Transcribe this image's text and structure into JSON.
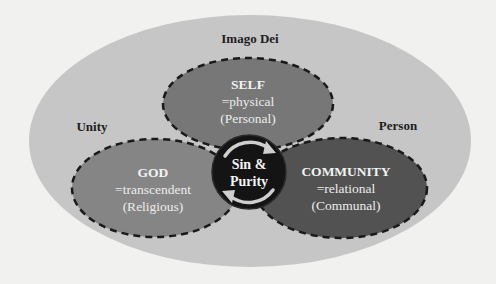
{
  "diagram": {
    "outer": {
      "title": "Imago Dei",
      "left_label": "Unity",
      "right_label": "Person",
      "fill": "#c6c6c6"
    },
    "circles": [
      {
        "id": "self",
        "title": "SELF",
        "subtitle": "=physical",
        "category": "(Personal)",
        "fill": "#777777"
      },
      {
        "id": "god",
        "title": "GOD",
        "subtitle": "=transcendent",
        "category": "(Religious)",
        "fill": "#858585"
      },
      {
        "id": "community",
        "title": "COMMUNITY",
        "subtitle": "=relational",
        "category": "(Communal)",
        "fill": "#525252"
      }
    ],
    "center": {
      "line1": "Sin &",
      "line2": "Purity",
      "fill": "#141414",
      "arrow_color": "#cfcfcf",
      "icon": "cycle-arrows-icon"
    },
    "border_style": "dashed",
    "border_color": "#1a1a1a"
  }
}
